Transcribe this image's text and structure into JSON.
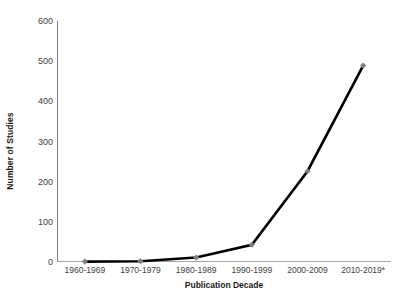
{
  "chart_data": {
    "type": "line",
    "title": "",
    "xlabel": "Publication Decade",
    "ylabel": "Number of Studies",
    "categories": [
      "1960-1969",
      "1970-1979",
      "1980-1989",
      "1990-1999",
      "2000-2009",
      "2010-2019*"
    ],
    "values": [
      1,
      2,
      11,
      43,
      226,
      489
    ],
    "ylim": [
      0,
      600
    ],
    "yticks": [
      0,
      100,
      200,
      300,
      400,
      500,
      600
    ],
    "ytick_labels": [
      "0",
      "100",
      "200",
      "300",
      "400",
      "500",
      "600"
    ],
    "grid": false,
    "legend": false,
    "series": [
      {
        "name": "Number of Studies",
        "values": [
          1,
          2,
          11,
          43,
          226,
          489
        ],
        "line_color": "#000000",
        "marker_color": "#808080",
        "marker": "diamond"
      }
    ],
    "colors": {
      "line": "#000000",
      "marker": "#808080",
      "axis": "#a6a6a6",
      "text": "#404040",
      "title_text": "#1a1a1a",
      "background": "#ffffff"
    }
  }
}
